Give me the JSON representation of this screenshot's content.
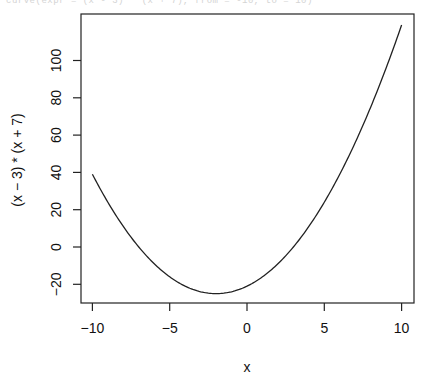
{
  "top_fragment": "curve(expr = (x - 3) * (x + 7), from = -10, to = 10)",
  "chart_data": {
    "type": "line",
    "title": "",
    "function": "(x - 3) * (x + 7)",
    "xlabel": "x",
    "ylabel": "(x − 3) * (x + 7)",
    "xlim": [
      -10.8,
      10.8
    ],
    "ylim": [
      -30,
      124
    ],
    "x_ticks": [
      -10,
      -5,
      0,
      5,
      10
    ],
    "x_tick_labels": [
      "−10",
      "−5",
      "0",
      "5",
      "10"
    ],
    "y_ticks": [
      -20,
      0,
      20,
      40,
      60,
      80,
      100
    ],
    "y_tick_labels": [
      "−20",
      "0",
      "20",
      "40",
      "60",
      "80",
      "100"
    ],
    "grid": false,
    "legend": null,
    "series": [
      {
        "name": "(x - 3) * (x + 7)",
        "color": "#222222",
        "x": [
          -10,
          -9,
          -8,
          -7,
          -6,
          -5,
          -4,
          -3,
          -2,
          -1,
          0,
          1,
          2,
          3,
          4,
          5,
          6,
          7,
          8,
          9,
          10
        ],
        "y": [
          39,
          24,
          11,
          0,
          -9,
          -16,
          -21,
          -24,
          -25,
          -24,
          -21,
          -16,
          -9,
          0,
          11,
          24,
          39,
          56,
          75,
          96,
          119
        ]
      }
    ]
  }
}
